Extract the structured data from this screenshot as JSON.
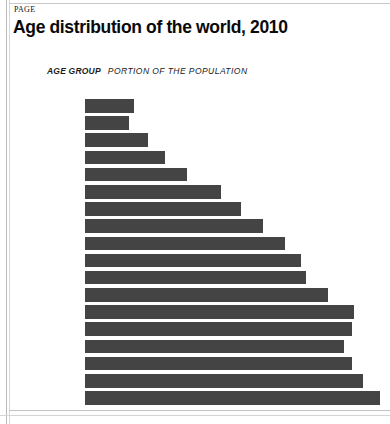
{
  "page": {
    "marker": "PAGE",
    "background": "#ffffff",
    "border_color": "#c9c9c9"
  },
  "chart_data": {
    "type": "bar",
    "orientation": "horizontal",
    "title": "Age distribution of the world, 2010",
    "subtitle_label": "AGE GROUP",
    "subtitle_value": "PORTION OF THE POPULATION",
    "xlabel": "",
    "ylabel": "",
    "bar_color": "#444444",
    "grid": false,
    "legend": false,
    "axis_labels_visible": false,
    "categories": [
      "85+",
      "80-84",
      "75-79",
      "70-74",
      "65-69",
      "60-64",
      "55-59",
      "50-54",
      "45-49",
      "40-44",
      "35-39",
      "30-34",
      "25-29",
      "20-24",
      "15-19",
      "10-14",
      "5-9",
      "0-4"
    ],
    "values": [
      49,
      44,
      63,
      80,
      102,
      136,
      156,
      178,
      200,
      216,
      221,
      243,
      269,
      267,
      259,
      267,
      278,
      295
    ],
    "value_unit": "relative portion of the population (arbitrary units)",
    "xlim": [
      0,
      295
    ],
    "bar_count": 18
  }
}
